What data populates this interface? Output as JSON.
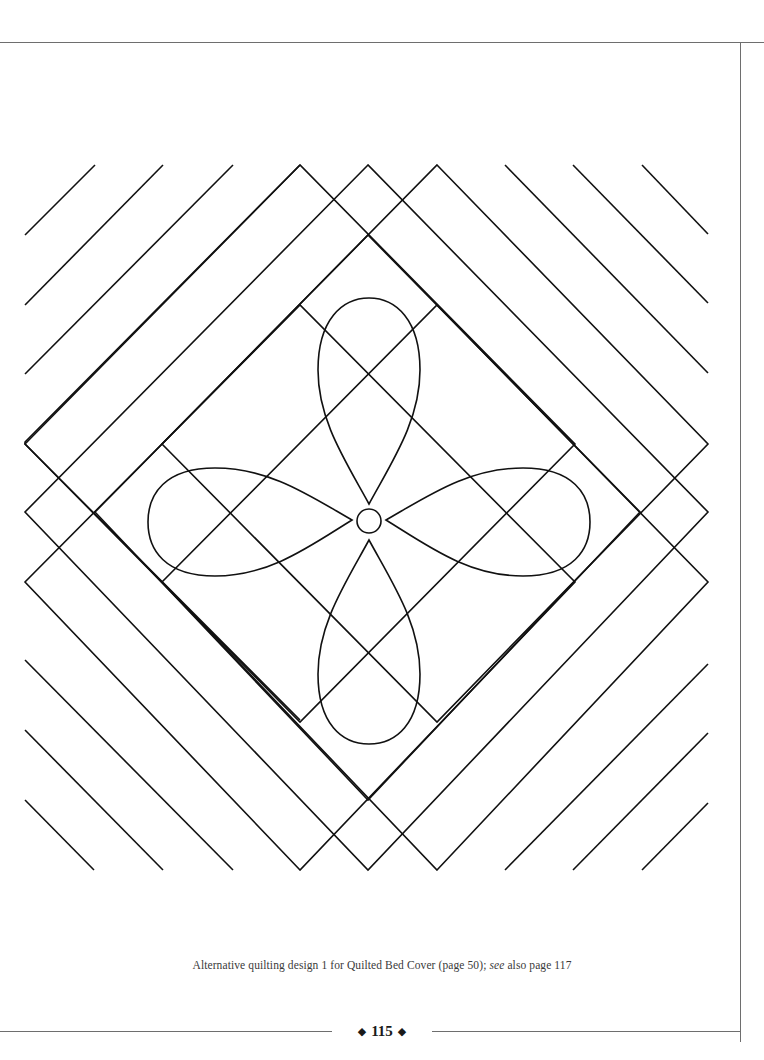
{
  "page": {
    "background_color": "#ffffff",
    "line_color": "#111111",
    "rule_color": "#6e6e6e"
  },
  "illustration": {
    "title": "Alternative quilting design 1",
    "elements": [
      "diagonal-parallel-lines",
      "nested-diamond-frames",
      "four-petal-flower",
      "center-circle"
    ]
  },
  "caption": {
    "prefix": "Alternative quilting design 1 for Quilted Bed Cover (page 50); ",
    "italic": "see",
    "suffix": " also page 117"
  },
  "folio": {
    "left_ornament": "◆",
    "page_number": "115",
    "right_ornament": "◆"
  }
}
